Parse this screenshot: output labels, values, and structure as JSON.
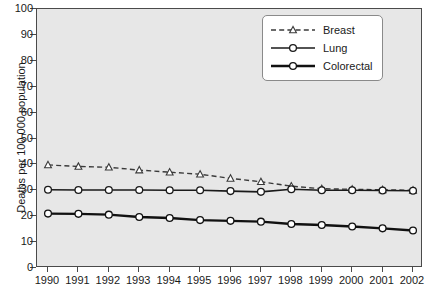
{
  "chart_data": {
    "type": "line",
    "title": "",
    "xlabel": "",
    "ylabel": "Deaths per 100 000 population",
    "x": [
      1990,
      1991,
      1992,
      1993,
      1994,
      1995,
      1996,
      1997,
      1998,
      1999,
      2000,
      2001,
      2002
    ],
    "categories": [
      "1990",
      "1991",
      "1992",
      "1993",
      "1994",
      "1995",
      "1996",
      "1997",
      "1998",
      "1999",
      "2000",
      "2001",
      "2002"
    ],
    "xlim": [
      1990,
      2002
    ],
    "ylim": [
      0,
      100
    ],
    "yticks": [
      0,
      10,
      20,
      30,
      40,
      50,
      60,
      70,
      80,
      90,
      100
    ],
    "ytick_labels": [
      "0",
      "10",
      "20",
      "30",
      "40",
      "50",
      "60",
      "70",
      "80",
      "90",
      "100"
    ],
    "grid": false,
    "legend_position": "upper right",
    "series": [
      {
        "name": "Breast",
        "values": [
          39.8,
          39.2,
          38.9,
          37.8,
          37.0,
          36.2,
          34.6,
          33.3,
          31.6,
          30.6,
          30.4,
          30.2,
          30.0
        ],
        "linestyle": "dashed",
        "marker": "triangle-open",
        "color": "#3a3a3a",
        "linewidth": 1.4
      },
      {
        "name": "Lung",
        "values": [
          30.2,
          30.1,
          30.1,
          30.1,
          30.0,
          30.0,
          29.7,
          29.4,
          30.4,
          30.0,
          30.0,
          29.9,
          29.8
        ],
        "linestyle": "solid",
        "marker": "circle-open",
        "color": "#1a1a1a",
        "linewidth": 1.6
      },
      {
        "name": "Colorectal",
        "values": [
          21.0,
          20.9,
          20.6,
          19.7,
          19.3,
          18.5,
          18.2,
          17.9,
          17.0,
          16.6,
          16.0,
          15.3,
          14.5
        ],
        "linestyle": "solid",
        "marker": "circle-open",
        "color": "#111111",
        "linewidth": 2.4
      }
    ]
  },
  "legend": {
    "entries": [
      {
        "label": "Breast"
      },
      {
        "label": "Lung"
      },
      {
        "label": "Colorectal"
      }
    ]
  },
  "colors": {
    "plot_background": "#e7e7e7",
    "figure_background": "#ffffff",
    "axis": "#4a4a4a",
    "text": "#1a1a1a",
    "legend_background": "#ffffff",
    "legend_border": "#8a8a8a"
  }
}
